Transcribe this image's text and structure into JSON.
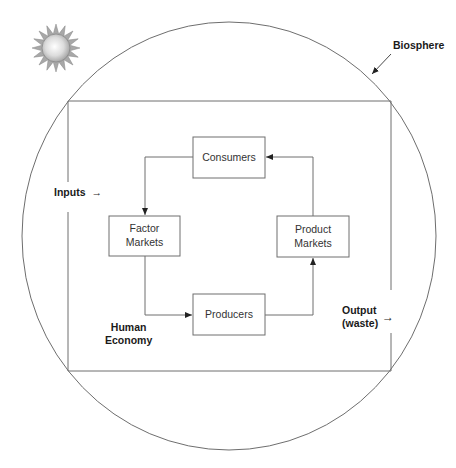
{
  "diagram": {
    "labels": {
      "biosphere": "Biosphere",
      "inputs": "Inputs",
      "inputs_arrow": "→",
      "output_line1": "Output",
      "output_line2": "(waste)",
      "output_arrow": "→",
      "economy_line1": "Human",
      "economy_line2": "Economy"
    },
    "nodes": [
      {
        "id": "consumers",
        "label_line1": "Consumers",
        "label_line2": ""
      },
      {
        "id": "factor_markets",
        "label_line1": "Factor",
        "label_line2": "Markets"
      },
      {
        "id": "product_markets",
        "label_line1": "Product",
        "label_line2": "Markets"
      },
      {
        "id": "producers",
        "label_line1": "Producers",
        "label_line2": ""
      }
    ],
    "edges": [
      {
        "from": "consumers",
        "to": "factor_markets"
      },
      {
        "from": "factor_markets",
        "to": "producers"
      },
      {
        "from": "producers",
        "to": "product_markets"
      },
      {
        "from": "product_markets",
        "to": "consumers"
      }
    ],
    "icons": {
      "sun": "sun-icon"
    },
    "colors": {
      "line": "#6e6e6e",
      "text": "#1a1a1a",
      "box_text": "#333333",
      "sun_body": "#c8c8c8",
      "sun_rays": "#9a9a9a"
    }
  }
}
